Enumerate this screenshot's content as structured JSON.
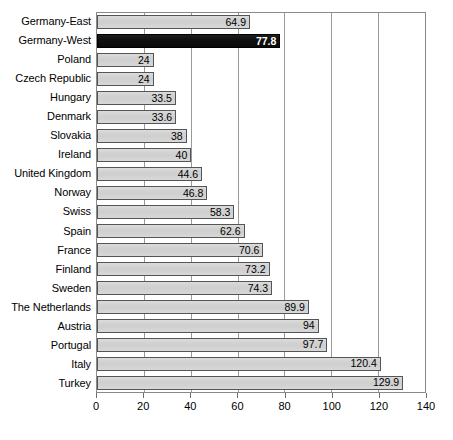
{
  "chart_data": {
    "type": "bar",
    "orientation": "horizontal",
    "title": "",
    "subtitle": "",
    "xlabel": "",
    "ylabel": "",
    "xlim": [
      0,
      140
    ],
    "xticks": [
      0,
      20,
      40,
      60,
      80,
      100,
      120,
      140
    ],
    "grid": true,
    "legend": null,
    "categories": [
      "Germany-East",
      "Germany-West",
      "Poland",
      "Czech Republic",
      "Hungary",
      "Denmark",
      "Slovakia",
      "Ireland",
      "United Kingdom",
      "Norway",
      "Swiss",
      "Spain",
      "France",
      "Finland",
      "Sweden",
      "The Netherlands",
      "Austria",
      "Portugal",
      "Italy",
      "Turkey"
    ],
    "values": [
      64.9,
      77.8,
      24,
      24,
      33.5,
      33.6,
      38,
      40,
      44.6,
      46.8,
      58.3,
      62.6,
      70.6,
      73.2,
      74.3,
      89.9,
      94,
      97.7,
      120.4,
      129.9
    ],
    "value_labels": [
      "64.9",
      "77.8",
      "24",
      "24",
      "33.5",
      "33.6",
      "38",
      "40",
      "44.6",
      "46.8",
      "58.3",
      "62.6",
      "70.6",
      "73.2",
      "74.3",
      "89.9",
      "94",
      "97.7",
      "120.4",
      "129.9"
    ],
    "highlight_index": 1,
    "bar_color": "#d4d4d4",
    "bar_border_color": "#555555",
    "highlight_color": "#151515",
    "highlight_label_color": "#ffffff",
    "gridline_color": "#9a9a9a",
    "axis_color": "#8a8a8a"
  },
  "axis": {
    "tick_labels": [
      "0",
      "20",
      "40",
      "60",
      "80",
      "100",
      "120",
      "140"
    ]
  }
}
